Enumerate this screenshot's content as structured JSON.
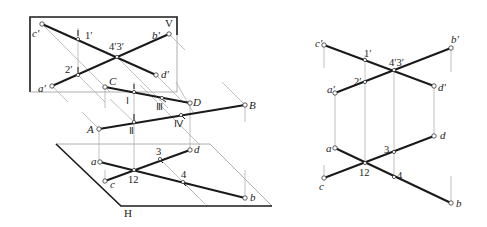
{
  "left_diagram": {
    "plane_v_label": "V",
    "plane_h_label": "H",
    "v_projection_labels": {
      "c_prime": "c′",
      "b_prime": "b′",
      "a_prime": "a′",
      "d_prime": "d′",
      "p1_prime": "1′",
      "p2_prime": "2′",
      "p43_prime": "4′3′"
    },
    "space_labels": {
      "A": "A",
      "B": "B",
      "C": "C",
      "D": "D",
      "I": "Ⅰ",
      "II": "Ⅱ",
      "III": "Ⅲ",
      "IV": "Ⅳ"
    },
    "h_projection_labels": {
      "a": "a",
      "b": "b",
      "c": "c",
      "d": "d",
      "p12": "12",
      "p3": "3",
      "p4": "4"
    }
  },
  "right_diagram": {
    "v_projection_labels": {
      "c_prime": "c′",
      "b_prime": "b′",
      "a_prime": "a′",
      "d_prime": "d′",
      "p1_prime": "1′",
      "p2_prime": "2′",
      "p43_prime": "4′3′"
    },
    "h_projection_labels": {
      "a": "a",
      "b": "b",
      "c": "c",
      "d": "d",
      "p12": "12",
      "p3": "3",
      "p4": "4"
    }
  },
  "colors": {
    "line": "#1a1a1a",
    "projection_line": "#9a9a9a",
    "background": "#ffffff"
  }
}
